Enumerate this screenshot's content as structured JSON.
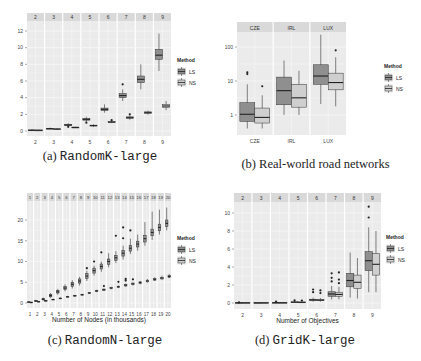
{
  "colors": {
    "panel_bg": "#ebebeb",
    "strip_bg": "#d9d9d9",
    "grid": "#f7f7f7",
    "ls_fill": "#8f8f8f",
    "ns_fill": "#cfcfcf",
    "line": "#333333"
  },
  "legend": {
    "title": "Method",
    "items": [
      "LS",
      "NS"
    ]
  },
  "captions": {
    "a": {
      "prefix": "(a) ",
      "name": "RandomK-large",
      "mono": true
    },
    "b": {
      "prefix": "(b) ",
      "name": "Real-world road networks",
      "mono": false
    },
    "c": {
      "prefix": "(c) ",
      "name": "RandomN-large",
      "mono": true
    },
    "d": {
      "prefix": "(d) ",
      "name": "GridK-large",
      "mono": true
    }
  },
  "chart_data": [
    {
      "id": "a",
      "type": "box",
      "title": "RandomK-large",
      "xlabel": "Number of Objectives",
      "ylabel": "",
      "scale": "linear",
      "ylim": [
        0,
        12
      ],
      "yticks": [
        0,
        2,
        4,
        6,
        8,
        10,
        12
      ],
      "categories": [
        "2",
        "3",
        "4",
        "5",
        "6",
        "7",
        "8",
        "9"
      ],
      "legend_title": "Method",
      "series": [
        {
          "name": "LS",
          "boxes": [
            {
              "lo": 0.05,
              "q1": 0.08,
              "med": 0.1,
              "q3": 0.12,
              "hi": 0.2,
              "out": []
            },
            {
              "lo": 0.2,
              "q1": 0.25,
              "med": 0.28,
              "q3": 0.32,
              "hi": 0.4,
              "out": []
            },
            {
              "lo": 0.55,
              "q1": 0.65,
              "med": 0.72,
              "q3": 0.8,
              "hi": 0.95,
              "out": [
                0.5
              ]
            },
            {
              "lo": 1.1,
              "q1": 1.3,
              "med": 1.4,
              "q3": 1.5,
              "hi": 1.7,
              "out": [
                1.0
              ]
            },
            {
              "lo": 2.2,
              "q1": 2.45,
              "med": 2.6,
              "q3": 2.75,
              "hi": 3.2,
              "out": []
            },
            {
              "lo": 3.6,
              "q1": 4.0,
              "med": 4.25,
              "q3": 4.5,
              "hi": 5.0,
              "out": [
                5.6
              ]
            },
            {
              "lo": 5.0,
              "q1": 5.8,
              "med": 6.2,
              "q3": 6.6,
              "hi": 8.0,
              "out": []
            },
            {
              "lo": 7.2,
              "q1": 8.6,
              "med": 9.1,
              "q3": 9.8,
              "hi": 11.7,
              "out": []
            }
          ]
        },
        {
          "name": "NS",
          "boxes": [
            {
              "lo": 0.05,
              "q1": 0.08,
              "med": 0.09,
              "q3": 0.11,
              "hi": 0.15,
              "out": []
            },
            {
              "lo": 0.15,
              "q1": 0.2,
              "med": 0.23,
              "q3": 0.26,
              "hi": 0.32,
              "out": []
            },
            {
              "lo": 0.35,
              "q1": 0.4,
              "med": 0.43,
              "q3": 0.46,
              "hi": 0.5,
              "out": []
            },
            {
              "lo": 0.5,
              "q1": 0.6,
              "med": 0.65,
              "q3": 0.7,
              "hi": 0.8,
              "out": []
            },
            {
              "lo": 0.95,
              "q1": 1.02,
              "med": 1.07,
              "q3": 1.12,
              "hi": 1.2,
              "out": [
                1.3
              ]
            },
            {
              "lo": 1.35,
              "q1": 1.5,
              "med": 1.6,
              "q3": 1.7,
              "hi": 1.85,
              "out": [
                2.0
              ]
            },
            {
              "lo": 1.95,
              "q1": 2.1,
              "med": 2.2,
              "q3": 2.3,
              "hi": 2.45,
              "out": []
            },
            {
              "lo": 2.5,
              "q1": 2.8,
              "med": 3.0,
              "q3": 3.2,
              "hi": 3.6,
              "out": []
            }
          ]
        }
      ]
    },
    {
      "id": "b",
      "type": "box",
      "title": "Real-world road networks",
      "xlabel": "",
      "ylabel": "",
      "scale": "log10",
      "ylim": [
        0.4,
        300
      ],
      "yticks": [
        1,
        10,
        100
      ],
      "ytick_labels": [
        "1",
        "10",
        "100"
      ],
      "categories": [
        "CZE",
        "IRL",
        "LUX"
      ],
      "legend_title": "Method",
      "series": [
        {
          "name": "LS",
          "boxes": [
            {
              "lo": 0.4,
              "q1": 0.65,
              "med": 1.05,
              "q3": 2.3,
              "hi": 8,
              "out": [
                16,
                18
              ]
            },
            {
              "lo": 1.0,
              "q1": 2.0,
              "med": 5.2,
              "q3": 13,
              "hi": 40,
              "out": []
            },
            {
              "lo": 2.1,
              "q1": 8,
              "med": 14,
              "q3": 30,
              "hi": 230,
              "out": []
            }
          ]
        },
        {
          "name": "NS",
          "boxes": [
            {
              "lo": 0.4,
              "q1": 0.58,
              "med": 0.85,
              "q3": 1.6,
              "hi": 3.8,
              "out": [
                7
              ]
            },
            {
              "lo": 1.0,
              "q1": 1.7,
              "med": 3.2,
              "q3": 8,
              "hi": 20,
              "out": []
            },
            {
              "lo": 1.8,
              "q1": 5.5,
              "med": 9,
              "q3": 17,
              "hi": 50,
              "out": [
                80
              ]
            }
          ]
        }
      ]
    },
    {
      "id": "c",
      "type": "box",
      "title": "RandomN-large",
      "xlabel": "Number of Nodes (in thousands)",
      "ylabel": "",
      "scale": "linear",
      "ylim": [
        0,
        22
      ],
      "yticks": [
        0,
        5,
        10,
        15,
        20
      ],
      "categories": [
        "1",
        "2",
        "3",
        "4",
        "5",
        "6",
        "7",
        "8",
        "9",
        "10",
        "11",
        "12",
        "13",
        "14",
        "15",
        "16",
        "17",
        "18",
        "19",
        "20"
      ],
      "legend_title": "Method",
      "series": [
        {
          "name": "LS",
          "medians": [
            0.2,
            0.5,
            0.9,
            1.8,
            2.7,
            3.6,
            4.5,
            5.3,
            6.5,
            7.8,
            8.8,
            10.0,
            10.9,
            12.0,
            13.2,
            14.2,
            15.5,
            17.0,
            18.2,
            19.2
          ],
          "q1": [
            0.15,
            0.4,
            0.75,
            1.5,
            2.4,
            3.2,
            4.0,
            4.8,
            5.9,
            7.2,
            8.2,
            9.3,
            10.3,
            11.3,
            12.5,
            13.5,
            14.7,
            16.2,
            17.4,
            18.4
          ],
          "q3": [
            0.3,
            0.6,
            1.05,
            2.1,
            3.0,
            4.0,
            5.0,
            5.8,
            7.1,
            8.4,
            9.4,
            10.6,
            11.5,
            12.7,
            13.9,
            14.9,
            16.3,
            17.8,
            19.0,
            20.0
          ],
          "lo": [
            0.1,
            0.3,
            0.6,
            1.2,
            2.0,
            2.8,
            3.5,
            4.2,
            5.3,
            6.6,
            7.5,
            8.6,
            9.6,
            10.5,
            11.8,
            12.6,
            13.8,
            15.2,
            16.5,
            17.5
          ],
          "hi": [
            0.4,
            0.7,
            1.3,
            2.4,
            3.4,
            4.5,
            5.5,
            6.3,
            7.8,
            9.0,
            10.0,
            12.0,
            12.5,
            13.8,
            15.5,
            16.5,
            19.5,
            22.0,
            22.5,
            23.0
          ],
          "out": [
            [],
            [],
            [],
            [],
            [],
            [],
            [],
            [],
            [
              8.4
            ],
            [
              10.0
            ],
            [
              12.2
            ],
            [],
            [
              16.2
            ],
            [
              18.2,
              15.6
            ],
            [
              17.5
            ],
            [],
            [],
            [],
            [],
            []
          ]
        },
        {
          "name": "NS",
          "medians": [
            0.15,
            0.35,
            0.55,
            0.85,
            1.1,
            1.5,
            1.75,
            2.0,
            2.4,
            2.9,
            3.2,
            3.6,
            3.9,
            4.3,
            4.6,
            4.9,
            5.3,
            5.7,
            6.0,
            6.4
          ],
          "q1": [
            0.1,
            0.3,
            0.5,
            0.8,
            1.0,
            1.4,
            1.65,
            1.9,
            2.3,
            2.75,
            3.05,
            3.45,
            3.75,
            4.1,
            4.4,
            4.7,
            5.1,
            5.5,
            5.8,
            6.2
          ],
          "q3": [
            0.2,
            0.4,
            0.6,
            0.9,
            1.2,
            1.6,
            1.85,
            2.1,
            2.5,
            3.05,
            3.35,
            3.75,
            4.05,
            4.5,
            4.8,
            5.1,
            5.5,
            5.9,
            6.2,
            6.6
          ],
          "lo": [
            0.05,
            0.25,
            0.45,
            0.75,
            0.95,
            1.3,
            1.55,
            1.8,
            2.2,
            2.6,
            2.9,
            3.3,
            3.6,
            3.9,
            4.2,
            4.5,
            4.9,
            5.3,
            5.6,
            6.0
          ],
          "hi": [
            0.25,
            0.45,
            0.65,
            1.0,
            1.3,
            1.7,
            1.95,
            2.2,
            2.65,
            3.2,
            3.5,
            3.9,
            4.2,
            4.7,
            5.0,
            5.3,
            5.8,
            6.2,
            6.6,
            7.0
          ],
          "out": [
            [],
            [],
            [],
            [],
            [],
            [],
            [],
            [],
            [],
            [],
            [
              4.1
            ],
            [],
            [
              5.1
            ],
            [
              5.8,
              5.4
            ],
            [
              5.7
            ],
            [],
            [],
            [],
            [],
            []
          ]
        }
      ]
    },
    {
      "id": "d",
      "type": "box",
      "title": "GridK-large",
      "xlabel": "Number of Objectives",
      "ylabel": "",
      "scale": "linear",
      "ylim": [
        0,
        11
      ],
      "yticks": [
        0,
        2,
        4,
        6,
        8,
        10
      ],
      "categories": [
        "2",
        "3",
        "4",
        "5",
        "6",
        "7",
        "8",
        "9"
      ],
      "legend_title": "Method",
      "series": [
        {
          "name": "LS",
          "boxes": [
            {
              "lo": 0.0,
              "q1": 0.01,
              "med": 0.02,
              "q3": 0.03,
              "hi": 0.05,
              "out": [
                0.07
              ]
            },
            {
              "lo": 0.0,
              "q1": 0.01,
              "med": 0.02,
              "q3": 0.03,
              "hi": 0.05,
              "out": []
            },
            {
              "lo": 0.0,
              "q1": 0.02,
              "med": 0.04,
              "q3": 0.06,
              "hi": 0.1,
              "out": [
                0.15
              ]
            },
            {
              "lo": 0.02,
              "q1": 0.06,
              "med": 0.09,
              "q3": 0.13,
              "hi": 0.2,
              "out": [
                0.3
              ]
            },
            {
              "lo": 0.15,
              "q1": 0.28,
              "med": 0.34,
              "q3": 0.42,
              "hi": 0.6,
              "out": [
                1.2,
                1.5
              ]
            },
            {
              "lo": 0.4,
              "q1": 0.75,
              "med": 1.0,
              "q3": 1.25,
              "hi": 1.9,
              "out": [
                2.4,
                2.8,
                3.3
              ]
            },
            {
              "lo": 0.6,
              "q1": 1.8,
              "med": 2.5,
              "q3": 3.3,
              "hi": 5.6,
              "out": []
            },
            {
              "lo": 1.2,
              "q1": 3.6,
              "med": 4.7,
              "q3": 5.7,
              "hi": 8.4,
              "out": [
                9.5,
                10.7
              ]
            }
          ]
        },
        {
          "name": "NS",
          "boxes": [
            {
              "lo": 0.0,
              "q1": 0.01,
              "med": 0.02,
              "q3": 0.03,
              "hi": 0.05,
              "out": []
            },
            {
              "lo": 0.0,
              "q1": 0.01,
              "med": 0.02,
              "q3": 0.03,
              "hi": 0.05,
              "out": []
            },
            {
              "lo": 0.0,
              "q1": 0.02,
              "med": 0.03,
              "q3": 0.05,
              "hi": 0.08,
              "out": []
            },
            {
              "lo": 0.02,
              "q1": 0.05,
              "med": 0.08,
              "q3": 0.11,
              "hi": 0.18,
              "out": [
                0.28
              ]
            },
            {
              "lo": 0.15,
              "q1": 0.26,
              "med": 0.32,
              "q3": 0.4,
              "hi": 0.55,
              "out": [
                1.1,
                1.4
              ]
            },
            {
              "lo": 0.4,
              "q1": 0.75,
              "med": 0.95,
              "q3": 1.2,
              "hi": 1.8,
              "out": [
                2.2,
                2.6,
                3.4
              ]
            },
            {
              "lo": 0.5,
              "q1": 1.6,
              "med": 2.3,
              "q3": 3.1,
              "hi": 5.0,
              "out": []
            },
            {
              "lo": 1.2,
              "q1": 3.1,
              "med": 4.3,
              "q3": 5.5,
              "hi": 8.0,
              "out": []
            }
          ]
        }
      ]
    }
  ]
}
